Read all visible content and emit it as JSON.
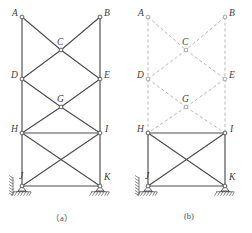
{
  "figure": {
    "type": "structural-truss-diagram",
    "panels": [
      {
        "id": "a",
        "caption": "（a）",
        "description": "full truss with all members solid",
        "origin_x": 0
      },
      {
        "id": "b",
        "caption": "(b)",
        "description": "same truss with upper members shown dashed",
        "origin_x": 126
      }
    ],
    "node_labels": {
      "A": "A",
      "B": "B",
      "C": "C",
      "D": "D",
      "E": "E",
      "G": "G",
      "H": "H",
      "I": "I",
      "J": "J",
      "K": "K"
    },
    "colors": {
      "solid_member": "#4d4d4d",
      "dashed_member": "#b9b9b9",
      "node_stroke": "#4d4d4d",
      "node_fill": "#ffffff",
      "label_text": "#3c3c3c",
      "caption_text": "#4a4a4a",
      "hatch": "#5a5a5a"
    },
    "geometry": {
      "panel_a": {
        "nodes": {
          "A": [
            22,
            17
          ],
          "B": [
            100,
            17
          ],
          "C": [
            61,
            50
          ],
          "D": [
            22,
            79
          ],
          "E": [
            100,
            79
          ],
          "G": [
            61,
            107
          ],
          "H": [
            22,
            133
          ],
          "I": [
            100,
            133
          ],
          "J": [
            22,
            186
          ],
          "K": [
            100,
            186
          ]
        },
        "solid_members": [
          [
            "A",
            "D"
          ],
          [
            "D",
            "H"
          ],
          [
            "H",
            "J"
          ],
          [
            "B",
            "E"
          ],
          [
            "E",
            "I"
          ],
          [
            "I",
            "K"
          ],
          [
            "A",
            "C"
          ],
          [
            "C",
            "E"
          ],
          [
            "B",
            "C"
          ],
          [
            "C",
            "D"
          ],
          [
            "D",
            "G"
          ],
          [
            "G",
            "I"
          ],
          [
            "E",
            "G"
          ],
          [
            "G",
            "H"
          ],
          [
            "H",
            "I"
          ],
          [
            "H",
            "K"
          ],
          [
            "I",
            "J"
          ],
          [
            "J",
            "K"
          ]
        ],
        "dashed_members": []
      },
      "panel_b": {
        "nodes": {
          "A": [
            148,
            17
          ],
          "B": [
            225,
            17
          ],
          "C": [
            186,
            50
          ],
          "D": [
            148,
            79
          ],
          "E": [
            225,
            79
          ],
          "G": [
            186,
            107
          ],
          "H": [
            148,
            133
          ],
          "I": [
            225,
            133
          ],
          "J": [
            148,
            186
          ],
          "K": [
            225,
            186
          ]
        },
        "solid_members": [
          [
            "H",
            "I"
          ],
          [
            "H",
            "J"
          ],
          [
            "I",
            "K"
          ],
          [
            "H",
            "K"
          ],
          [
            "I",
            "J"
          ],
          [
            "J",
            "K"
          ]
        ],
        "dashed_members": [
          [
            "A",
            "D"
          ],
          [
            "D",
            "H"
          ],
          [
            "B",
            "E"
          ],
          [
            "E",
            "I"
          ],
          [
            "A",
            "C"
          ],
          [
            "C",
            "E"
          ],
          [
            "B",
            "C"
          ],
          [
            "C",
            "D"
          ],
          [
            "D",
            "G"
          ],
          [
            "G",
            "I"
          ],
          [
            "E",
            "G"
          ],
          [
            "G",
            "H"
          ]
        ]
      }
    },
    "supports": [
      {
        "panel": "a",
        "node": "J",
        "kind": "pin-with-wall-and-ground"
      },
      {
        "panel": "a",
        "node": "K",
        "kind": "pin-on-ground"
      },
      {
        "panel": "b",
        "node": "J",
        "kind": "pin-with-wall-and-ground"
      },
      {
        "panel": "b",
        "node": "K",
        "kind": "pin-on-ground"
      }
    ]
  }
}
